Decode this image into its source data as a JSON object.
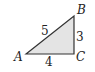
{
  "diagram": {
    "type": "right-triangle",
    "fill_color": "#e4e4e4",
    "stroke_color": "#333333",
    "vertices": {
      "A": {
        "label": "A"
      },
      "B": {
        "label": "B"
      },
      "C": {
        "label": "C"
      }
    },
    "sides": {
      "AB": {
        "label": "5"
      },
      "BC": {
        "label": "3"
      },
      "AC": {
        "label": "4"
      }
    },
    "right_angle_at": "C"
  }
}
